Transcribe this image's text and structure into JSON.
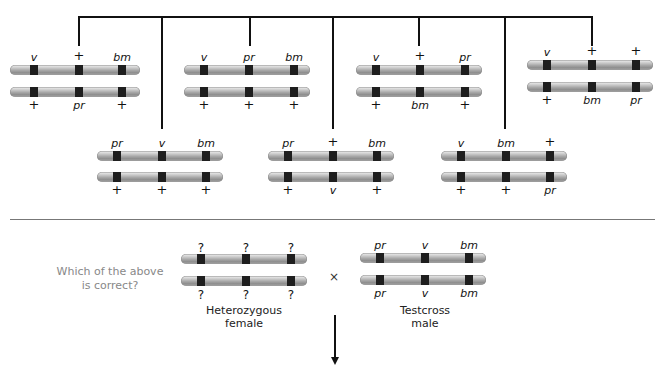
{
  "top_row": [
    {
      "top": [
        "v",
        "+",
        "bm"
      ],
      "bottom": [
        "+",
        "pr",
        "+"
      ]
    },
    {
      "top": [
        "v",
        "pr",
        "bm"
      ],
      "bottom": [
        "+",
        "+",
        "+"
      ]
    },
    {
      "top": [
        "v",
        "+",
        "pr"
      ],
      "bottom": [
        "+",
        "bm",
        "+"
      ]
    },
    {
      "top": [
        "v",
        "+",
        "+"
      ],
      "bottom": [
        "+",
        "bm",
        "pr"
      ]
    }
  ],
  "middle_row": [
    {
      "top": [
        "pr",
        "v",
        "bm"
      ],
      "bottom": [
        "+",
        "+",
        "+"
      ]
    },
    {
      "top": [
        "pr",
        "+",
        "bm"
      ],
      "bottom": [
        "+",
        "v",
        "+"
      ]
    },
    {
      "top": [
        "v",
        "bm",
        "+"
      ],
      "bottom": [
        "+",
        "+",
        "pr"
      ]
    }
  ],
  "cross": {
    "question_line1": "Which of the above",
    "question_line2": "is correct?",
    "female": {
      "top": [
        "?",
        "?",
        "?"
      ],
      "bottom": [
        "?",
        "?",
        "?"
      ],
      "caption_line1": "Heterozygous",
      "caption_line2": "female"
    },
    "times_symbol": "×",
    "male": {
      "top": [
        "pr",
        "v",
        "bm"
      ],
      "bottom": [
        "pr",
        "v",
        "bm"
      ],
      "caption_line1": "Testcross",
      "caption_line2": "male"
    }
  },
  "colors": {
    "band": "#1e1e1e",
    "line": "#111111",
    "question_text": "#888888"
  }
}
